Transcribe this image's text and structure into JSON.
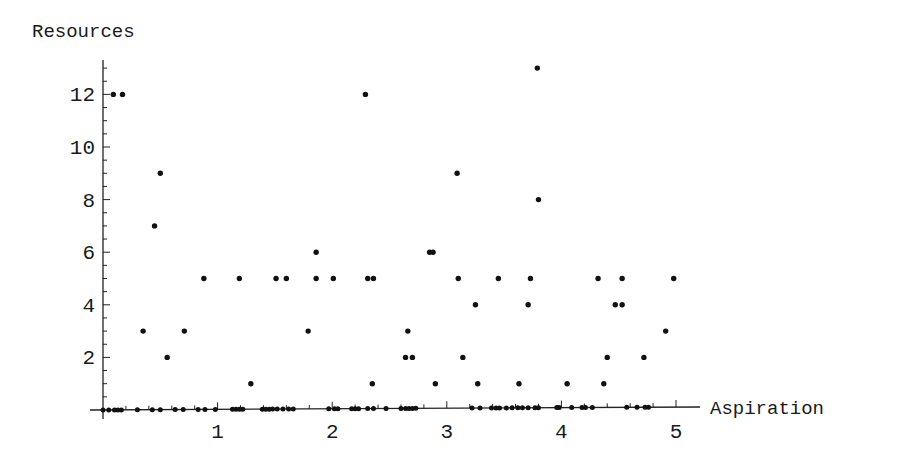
{
  "chart_data": {
    "type": "scatter",
    "title": "",
    "xlabel": "Aspiration",
    "ylabel": "Resources",
    "xlim": [
      0,
      5.1
    ],
    "ylim": [
      0,
      13.2
    ],
    "grid": false,
    "legend": null,
    "x_ticks": [
      1,
      2,
      3,
      4,
      5
    ],
    "y_ticks": [
      2,
      4,
      6,
      8,
      10,
      12
    ],
    "point_color": "#111111",
    "points_nonzero": [
      [
        0.09,
        12
      ],
      [
        0.17,
        12
      ],
      [
        0.45,
        7
      ],
      [
        0.5,
        9
      ],
      [
        0.35,
        3
      ],
      [
        0.56,
        2
      ],
      [
        0.71,
        3
      ],
      [
        0.88,
        5
      ],
      [
        1.19,
        5
      ],
      [
        1.29,
        1
      ],
      [
        1.51,
        5
      ],
      [
        1.6,
        5
      ],
      [
        1.79,
        3
      ],
      [
        1.86,
        6
      ],
      [
        1.86,
        5
      ],
      [
        2.01,
        5
      ],
      [
        2.29,
        12
      ],
      [
        2.31,
        5
      ],
      [
        2.36,
        5
      ],
      [
        2.35,
        1
      ],
      [
        2.64,
        2
      ],
      [
        2.66,
        3
      ],
      [
        2.7,
        2
      ],
      [
        2.85,
        6
      ],
      [
        2.88,
        6
      ],
      [
        2.9,
        1
      ],
      [
        3.09,
        9
      ],
      [
        3.1,
        5
      ],
      [
        3.14,
        2
      ],
      [
        3.25,
        4
      ],
      [
        3.27,
        1
      ],
      [
        3.45,
        5
      ],
      [
        3.63,
        1
      ],
      [
        3.71,
        4
      ],
      [
        3.73,
        5
      ],
      [
        3.79,
        13
      ],
      [
        3.8,
        8
      ],
      [
        4.05,
        1
      ],
      [
        4.32,
        5
      ],
      [
        4.37,
        1
      ],
      [
        4.4,
        2
      ],
      [
        4.47,
        4
      ],
      [
        4.53,
        4
      ],
      [
        4.53,
        5
      ],
      [
        4.72,
        2
      ],
      [
        4.91,
        3
      ],
      [
        4.98,
        5
      ]
    ],
    "points_zero_x": [
      0.0,
      0.05,
      0.1,
      0.13,
      0.16,
      0.3,
      0.43,
      0.5,
      0.63,
      0.7,
      0.83,
      0.89,
      0.98,
      1.13,
      1.16,
      1.19,
      1.22,
      1.39,
      1.42,
      1.45,
      1.48,
      1.52,
      1.57,
      1.62,
      1.66,
      1.97,
      2.02,
      2.05,
      2.17,
      2.2,
      2.23,
      2.31,
      2.36,
      2.47,
      2.6,
      2.64,
      2.67,
      2.7,
      2.73,
      3.22,
      3.29,
      3.39,
      3.43,
      3.46,
      3.52,
      3.57,
      3.62,
      3.66,
      3.71,
      3.77,
      3.8,
      3.96,
      3.98,
      4.09,
      4.18,
      4.21,
      4.27,
      4.57,
      4.66,
      4.73,
      4.76
    ]
  }
}
